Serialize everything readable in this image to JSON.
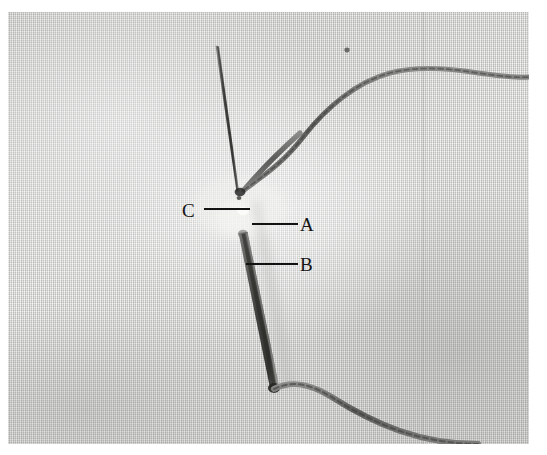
{
  "figure": {
    "kind": "photograph",
    "background_color": "#ffffff",
    "plate": {
      "fabric_color": "#d4d4d2",
      "fabric_highlight": "#ececea",
      "fabric_shadow": "#9d9d9b",
      "needle_color": "#4a4a4a",
      "thread_color": "#636361",
      "annotation_color": "#121212"
    },
    "annotations": [
      {
        "id": "c",
        "letter": "C",
        "target": "needle eye / thread junction at cloth surface"
      },
      {
        "id": "a",
        "letter": "A",
        "target": "upper puncture point in cloth"
      },
      {
        "id": "b",
        "letter": "B",
        "target": "lower needle shaft emerging from cloth"
      }
    ]
  }
}
